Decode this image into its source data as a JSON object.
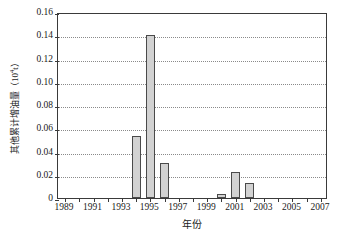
{
  "chart_data": {
    "type": "bar",
    "title": "",
    "subtitle": "",
    "xlabel": "年份",
    "ylabel": "其他累计增油量（10⁴t）",
    "ylabel_base": "其他累计增油量（10",
    "ylabel_sup": "4",
    "ylabel_tail": "t）",
    "categories": [
      1989,
      1990,
      1991,
      1992,
      1993,
      1994,
      1995,
      1996,
      1997,
      1998,
      1999,
      2000,
      2001,
      2002,
      2003,
      2004,
      2005,
      2006,
      2007
    ],
    "values": [
      0,
      0,
      0,
      0,
      0,
      0.053,
      0.14,
      0.03,
      0,
      0,
      0,
      0.0035,
      0.0225,
      0.013,
      0,
      0,
      0,
      0,
      0
    ],
    "series": [
      {
        "name": "其他累计增油量",
        "values": [
          0,
          0,
          0,
          0,
          0,
          0.053,
          0.14,
          0.03,
          0,
          0,
          0,
          0.0035,
          0.0225,
          0.013,
          0,
          0,
          0,
          0,
          0
        ]
      }
    ],
    "nonzero_points": [
      {
        "year": 1994,
        "value": 0.053
      },
      {
        "year": 1995,
        "value": 0.14
      },
      {
        "year": 1996,
        "value": 0.03
      },
      {
        "year": 2000,
        "value": 0.0035
      },
      {
        "year": 2001,
        "value": 0.0225
      },
      {
        "year": 2002,
        "value": 0.013
      }
    ],
    "ylim": [
      0,
      0.16
    ],
    "xlim": [
      1988.5,
      2007.5
    ],
    "ytick_values": [
      0,
      0.02,
      0.04,
      0.06,
      0.08,
      0.1,
      0.12,
      0.14,
      0.16
    ],
    "ytick_labels": [
      "0",
      "0.02",
      "0.04",
      "0.06",
      "0.08",
      "0.10",
      "0.12",
      "0.14",
      "0.16"
    ],
    "xtick_values": [
      1989,
      1991,
      1993,
      1995,
      1997,
      1999,
      2001,
      2003,
      2005,
      2007
    ],
    "xtick_labels": [
      "1989",
      "1991",
      "1993",
      "1995",
      "1997",
      "1999",
      "2001",
      "2003",
      "2005",
      "2007"
    ],
    "grid": {
      "horizontal": true,
      "vertical": false,
      "style": "dotted",
      "color": "#8a8a8a"
    },
    "legend": {
      "visible": false,
      "position": "none"
    },
    "bar_fill_color": "#d2d2d2",
    "bar_border_color": "#4a4a4a",
    "axis_color": "#3a3a3a",
    "background_color": "#ffffff"
  }
}
